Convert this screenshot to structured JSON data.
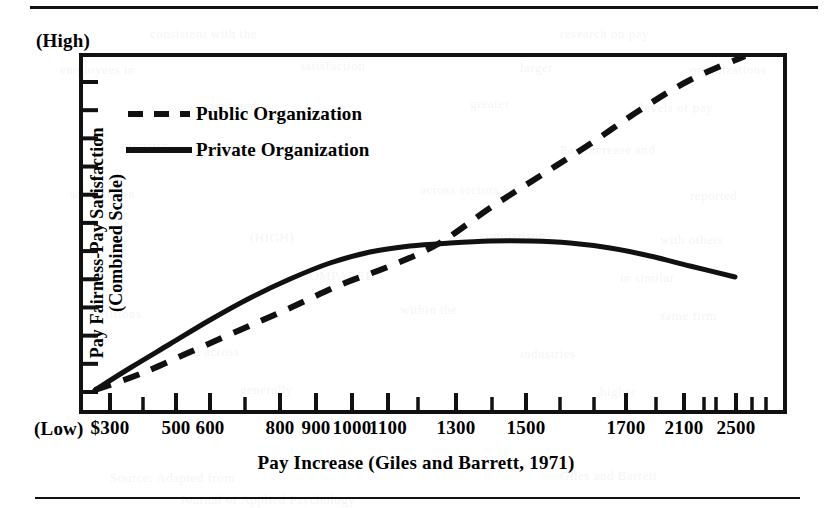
{
  "figure": {
    "y_axis": {
      "title_line1": "Pay Fairness-Pay Satisfaction",
      "title_line2": "(Combined Scale)",
      "high_label": "(High)",
      "low_label": "(Low)",
      "tick_count": 12
    },
    "x_axis": {
      "title": "Pay Increase (Giles and Barrett, 1971)"
    },
    "legend": {
      "public_label": "Public Organization",
      "private_label": "Private Organization"
    }
  },
  "ghost_text": [
    {
      "x": 150,
      "y": 26,
      "text": "consistent with the"
    },
    {
      "x": 560,
      "y": 26,
      "text": "research on pay"
    },
    {
      "x": 60,
      "y": 62,
      "text": "employees in"
    },
    {
      "x": 300,
      "y": 58,
      "text": "satisfaction"
    },
    {
      "x": 520,
      "y": 60,
      "text": "larger"
    },
    {
      "x": 690,
      "y": 62,
      "text": "organizations"
    },
    {
      "x": 210,
      "y": 98,
      "text": "reported"
    },
    {
      "x": 470,
      "y": 96,
      "text": "greater"
    },
    {
      "x": 640,
      "y": 100,
      "text": "levels of pay"
    },
    {
      "x": 120,
      "y": 140,
      "text": "FIGURE"
    },
    {
      "x": 330,
      "y": 138,
      "text": "3.2"
    },
    {
      "x": 560,
      "y": 142,
      "text": "Pay increase and"
    },
    {
      "x": 70,
      "y": 186,
      "text": "satisfaction"
    },
    {
      "x": 420,
      "y": 182,
      "text": "across sectors"
    },
    {
      "x": 690,
      "y": 188,
      "text": "reported"
    },
    {
      "x": 250,
      "y": 230,
      "text": "(HIGH)"
    },
    {
      "x": 480,
      "y": 228,
      "text": "comparisons"
    },
    {
      "x": 660,
      "y": 232,
      "text": "with others"
    },
    {
      "x": 300,
      "y": 268,
      "text": "COMPARED"
    },
    {
      "x": 620,
      "y": 270,
      "text": "in similar"
    },
    {
      "x": 90,
      "y": 306,
      "text": "positions"
    },
    {
      "x": 400,
      "y": 302,
      "text": "within the"
    },
    {
      "x": 660,
      "y": 308,
      "text": "same firm"
    },
    {
      "x": 180,
      "y": 344,
      "text": "and across"
    },
    {
      "x": 520,
      "y": 346,
      "text": "industries"
    },
    {
      "x": 240,
      "y": 382,
      "text": "generally"
    },
    {
      "x": 600,
      "y": 384,
      "text": "higher"
    },
    {
      "x": 110,
      "y": 470,
      "text": "Source: Adapted from"
    },
    {
      "x": 560,
      "y": 468,
      "text": "Giles and Barrett"
    },
    {
      "x": 180,
      "y": 492,
      "text": "Journal of Applied Psychology"
    }
  ],
  "chart_data": {
    "type": "line",
    "title": "",
    "xlabel": "Pay Increase (Giles and Barrett, 1971)",
    "ylabel": "Pay Fairness-Pay Satisfaction (Combined Scale)",
    "ylim_labels": [
      "(Low)",
      "(High)"
    ],
    "x_tick_labels": [
      "$300",
      "500",
      "600",
      "800",
      "900",
      "1000",
      "1100",
      "1300",
      "1500",
      "1700",
      "2100",
      "2500"
    ],
    "x_tick_positions_px": [
      110,
      176,
      210,
      280,
      316,
      352,
      388,
      456,
      526,
      626,
      684,
      736
    ],
    "x_minor_tick_positions_px": [
      143,
      245,
      418,
      492,
      560,
      594,
      656,
      704,
      716,
      752,
      766
    ],
    "grid": false,
    "legend_position": "upper-left-inside",
    "series": [
      {
        "name": "Public Organization",
        "style": "dashed",
        "points_px": [
          [
            95,
            390
          ],
          [
            140,
            374
          ],
          [
            190,
            352
          ],
          [
            240,
            330
          ],
          [
            290,
            308
          ],
          [
            340,
            285
          ],
          [
            390,
            266
          ],
          [
            438,
            244
          ],
          [
            490,
            208
          ],
          [
            540,
            176
          ],
          [
            590,
            144
          ],
          [
            640,
            110
          ],
          [
            690,
            80
          ],
          [
            745,
            56
          ]
        ],
        "description": "Rises steadily and nearly linearly from low to high; crosses the private curve near $1100 and reaches the top of the scale at about $2100."
      },
      {
        "name": "Private Organization",
        "style": "solid",
        "points_px": [
          [
            95,
            390
          ],
          [
            130,
            368
          ],
          [
            170,
            344
          ],
          [
            210,
            320
          ],
          [
            250,
            298
          ],
          [
            290,
            279
          ],
          [
            330,
            263
          ],
          [
            370,
            252
          ],
          [
            410,
            246
          ],
          [
            450,
            243
          ],
          [
            490,
            241
          ],
          [
            530,
            241
          ],
          [
            570,
            243
          ],
          [
            610,
            248
          ],
          [
            650,
            256
          ],
          [
            690,
            266
          ],
          [
            735,
            277
          ]
        ],
        "description": "Rises quickly at first, flattens into a plateau near $1100-$1300, then declines gradually toward $2100."
      }
    ],
    "plot_area_px": {
      "left": 81,
      "top": 55,
      "right": 785,
      "bottom": 412
    }
  }
}
